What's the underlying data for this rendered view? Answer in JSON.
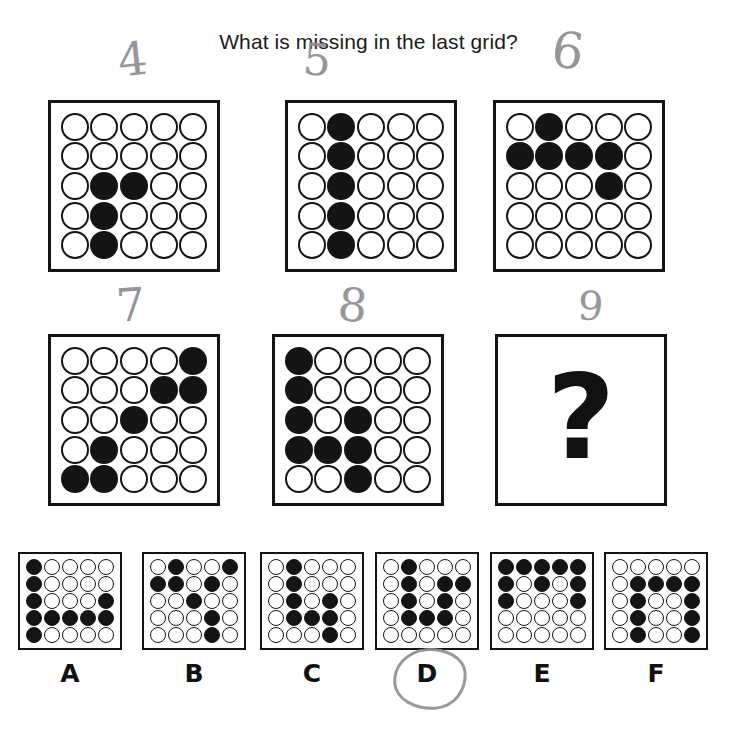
{
  "title": "What is missing in the last grid?",
  "colors": {
    "ink": "#141414",
    "pencil": "#8d8d92",
    "paper": "#ffffff"
  },
  "qmark": {
    "glyph": "?",
    "label": "question-mark"
  },
  "annotations": {
    "grid_numbers": [
      "4",
      "5",
      "6",
      "7",
      "8",
      "9"
    ],
    "circled_option": "D"
  },
  "matrix": {
    "rows": 5,
    "cols": 5,
    "panels": [
      {
        "id": "panel-1",
        "position": "row1-col1",
        "pencil_number": "4",
        "filled": [
          [
            0,
            0,
            0,
            0,
            0
          ],
          [
            0,
            0,
            0,
            0,
            0
          ],
          [
            0,
            1,
            1,
            0,
            0
          ],
          [
            0,
            1,
            0,
            0,
            0
          ],
          [
            0,
            1,
            0,
            0,
            0
          ]
        ]
      },
      {
        "id": "panel-2",
        "position": "row1-col2",
        "pencil_number": "5",
        "filled": [
          [
            0,
            1,
            0,
            0,
            0
          ],
          [
            0,
            1,
            0,
            0,
            0
          ],
          [
            0,
            1,
            0,
            0,
            0
          ],
          [
            0,
            1,
            0,
            0,
            0
          ],
          [
            0,
            1,
            0,
            0,
            0
          ]
        ]
      },
      {
        "id": "panel-3",
        "position": "row1-col3",
        "pencil_number": "6",
        "filled": [
          [
            0,
            1,
            0,
            0,
            0
          ],
          [
            1,
            1,
            1,
            1,
            0
          ],
          [
            0,
            0,
            0,
            1,
            0
          ],
          [
            0,
            0,
            0,
            0,
            0
          ],
          [
            0,
            0,
            0,
            0,
            0
          ]
        ]
      },
      {
        "id": "panel-4",
        "position": "row2-col1",
        "pencil_number": "7",
        "filled": [
          [
            0,
            0,
            0,
            0,
            1
          ],
          [
            0,
            0,
            0,
            1,
            1
          ],
          [
            0,
            0,
            1,
            0,
            0
          ],
          [
            0,
            1,
            0,
            0,
            0
          ],
          [
            1,
            1,
            0,
            0,
            0
          ]
        ]
      },
      {
        "id": "panel-5",
        "position": "row2-col2",
        "pencil_number": "8",
        "filled": [
          [
            1,
            0,
            0,
            0,
            0
          ],
          [
            1,
            0,
            0,
            0,
            0
          ],
          [
            1,
            0,
            1,
            0,
            0
          ],
          [
            1,
            1,
            1,
            0,
            0
          ],
          [
            0,
            0,
            1,
            0,
            0
          ]
        ]
      },
      {
        "id": "panel-6",
        "position": "row2-col3",
        "pencil_number": "9",
        "is_question": true,
        "filled": [
          [
            0,
            0,
            0,
            0,
            0
          ],
          [
            0,
            0,
            0,
            0,
            0
          ],
          [
            0,
            0,
            0,
            0,
            0
          ],
          [
            0,
            0,
            0,
            0,
            0
          ],
          [
            0,
            0,
            0,
            0,
            0
          ]
        ]
      }
    ]
  },
  "options": [
    {
      "label": "A",
      "filled": [
        [
          1,
          0,
          0,
          0,
          0
        ],
        [
          1,
          0,
          0,
          0,
          0
        ],
        [
          1,
          0,
          0,
          0,
          1
        ],
        [
          1,
          1,
          1,
          1,
          1
        ],
        [
          1,
          0,
          0,
          0,
          0
        ]
      ],
      "selected": false
    },
    {
      "label": "B",
      "filled": [
        [
          0,
          1,
          0,
          0,
          1
        ],
        [
          1,
          1,
          0,
          1,
          0
        ],
        [
          0,
          0,
          1,
          0,
          0
        ],
        [
          0,
          0,
          0,
          1,
          0
        ],
        [
          0,
          0,
          0,
          1,
          0
        ]
      ],
      "selected": false
    },
    {
      "label": "C",
      "filled": [
        [
          0,
          1,
          0,
          0,
          0
        ],
        [
          0,
          1,
          0,
          0,
          0
        ],
        [
          0,
          1,
          0,
          1,
          0
        ],
        [
          0,
          1,
          1,
          1,
          0
        ],
        [
          0,
          0,
          0,
          1,
          0
        ]
      ],
      "selected": false
    },
    {
      "label": "D",
      "filled": [
        [
          0,
          1,
          0,
          0,
          0
        ],
        [
          0,
          1,
          0,
          1,
          1
        ],
        [
          0,
          1,
          0,
          1,
          0
        ],
        [
          0,
          1,
          1,
          1,
          0
        ],
        [
          0,
          0,
          0,
          0,
          0
        ]
      ],
      "selected": true
    },
    {
      "label": "E",
      "filled": [
        [
          1,
          1,
          1,
          1,
          1
        ],
        [
          1,
          0,
          1,
          0,
          1
        ],
        [
          1,
          0,
          0,
          0,
          1
        ],
        [
          0,
          0,
          0,
          0,
          0
        ],
        [
          0,
          0,
          0,
          0,
          0
        ]
      ],
      "selected": false
    },
    {
      "label": "F",
      "filled": [
        [
          0,
          0,
          0,
          0,
          0
        ],
        [
          0,
          1,
          1,
          1,
          1
        ],
        [
          0,
          1,
          0,
          0,
          1
        ],
        [
          0,
          1,
          0,
          0,
          1
        ],
        [
          0,
          1,
          0,
          0,
          1
        ]
      ],
      "selected": false
    }
  ]
}
